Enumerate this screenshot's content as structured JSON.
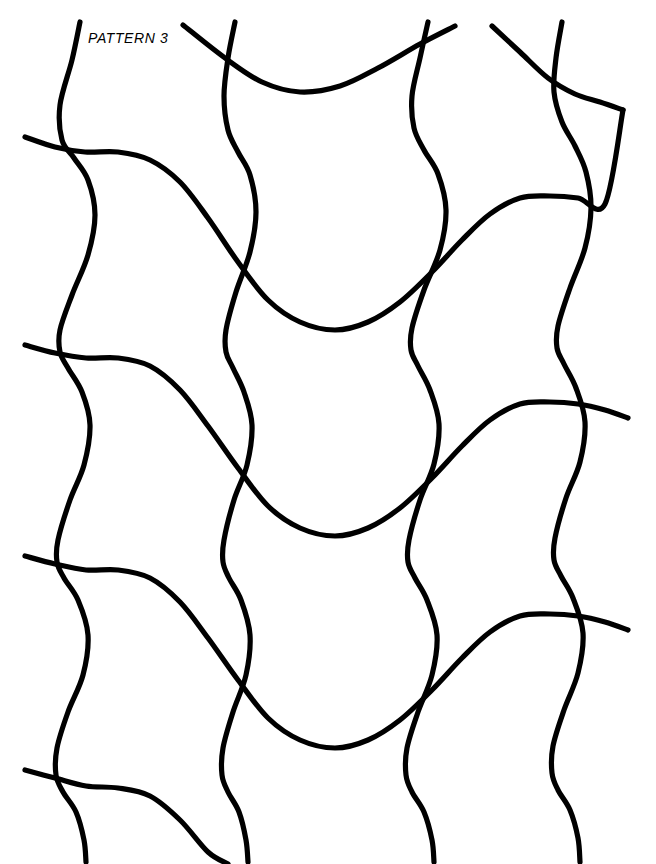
{
  "page": {
    "title": "Pattern 3",
    "width": 656,
    "height": 864,
    "background_color": "#ffffff"
  },
  "label": {
    "text": "PATTERN 3",
    "color": "#000000",
    "x": 88,
    "y": 30,
    "font_size": 14,
    "italic": true
  },
  "artwork": {
    "name": "wavy-lattice",
    "stroke_color": "#000000",
    "stroke_width": 5.2,
    "stroke_linecap": "round",
    "fill": "none",
    "description": "Interlocking grid of vertical wavy lines and gently descending horizontal wavy lines",
    "vertical_lines": {
      "count": 5,
      "x_starts": [
        80,
        235,
        390,
        545,
        700
      ],
      "amplitude": 22,
      "period": 210,
      "phase": 0,
      "drift_per_period": -4
    },
    "horizontal_lines": {
      "count": 5,
      "y_starts": [
        -72,
        137,
        345,
        556,
        770
      ],
      "x_start": 25,
      "x_end": 632,
      "amplitude": 30,
      "period": 208,
      "rise": -28
    }
  },
  "chart_data": {
    "type": "line",
    "title": "PATTERN 3",
    "xlabel": "",
    "ylabel": "",
    "grid": false,
    "legend": "none",
    "xlim": [
      0,
      656
    ],
    "ylim": [
      0,
      864
    ],
    "series": [
      {
        "name": "vertical-wave-1",
        "orientation": "vertical",
        "points": [
          [
            80,
            22
          ],
          [
            72,
            60
          ],
          [
            60,
            105
          ],
          [
            62,
            140
          ],
          [
            74,
            158
          ],
          [
            88,
            180
          ],
          [
            95,
            215
          ],
          [
            88,
            255
          ],
          [
            72,
            295
          ],
          [
            60,
            330
          ],
          [
            60,
            352
          ],
          [
            68,
            368
          ],
          [
            82,
            392
          ],
          [
            90,
            425
          ],
          [
            84,
            465
          ],
          [
            70,
            500
          ],
          [
            58,
            540
          ],
          [
            57,
            562
          ],
          [
            64,
            578
          ],
          [
            78,
            600
          ],
          [
            88,
            635
          ],
          [
            83,
            675
          ],
          [
            68,
            712
          ],
          [
            57,
            748
          ],
          [
            56,
            775
          ],
          [
            63,
            792
          ],
          [
            76,
            812
          ],
          [
            84,
            840
          ],
          [
            86,
            862
          ]
        ]
      },
      {
        "name": "vertical-wave-2",
        "orientation": "vertical",
        "points": [
          [
            235,
            22
          ],
          [
            228,
            58
          ],
          [
            224,
            96
          ],
          [
            228,
            130
          ],
          [
            238,
            152
          ],
          [
            250,
            175
          ],
          [
            256,
            212
          ],
          [
            250,
            252
          ],
          [
            236,
            292
          ],
          [
            226,
            330
          ],
          [
            226,
            352
          ],
          [
            233,
            368
          ],
          [
            244,
            392
          ],
          [
            252,
            425
          ],
          [
            247,
            465
          ],
          [
            234,
            500
          ],
          [
            224,
            540
          ],
          [
            223,
            562
          ],
          [
            229,
            578
          ],
          [
            241,
            600
          ],
          [
            250,
            635
          ],
          [
            246,
            675
          ],
          [
            233,
            712
          ],
          [
            223,
            748
          ],
          [
            222,
            775
          ],
          [
            228,
            792
          ],
          [
            239,
            812
          ],
          [
            246,
            840
          ],
          [
            248,
            862
          ]
        ]
      },
      {
        "name": "vertical-wave-3",
        "orientation": "vertical",
        "points": [
          [
            428,
            22
          ],
          [
            420,
            58
          ],
          [
            412,
            96
          ],
          [
            414,
            128
          ],
          [
            424,
            150
          ],
          [
            438,
            174
          ],
          [
            446,
            210
          ],
          [
            440,
            250
          ],
          [
            424,
            290
          ],
          [
            412,
            328
          ],
          [
            411,
            350
          ],
          [
            418,
            366
          ],
          [
            430,
            390
          ],
          [
            439,
            424
          ],
          [
            434,
            464
          ],
          [
            420,
            500
          ],
          [
            409,
            540
          ],
          [
            408,
            562
          ],
          [
            415,
            578
          ],
          [
            427,
            600
          ],
          [
            437,
            635
          ],
          [
            432,
            675
          ],
          [
            418,
            712
          ],
          [
            407,
            748
          ],
          [
            406,
            775
          ],
          [
            412,
            792
          ],
          [
            424,
            812
          ],
          [
            432,
            840
          ],
          [
            434,
            862
          ]
        ]
      },
      {
        "name": "vertical-wave-4",
        "orientation": "vertical",
        "points": [
          [
            562,
            22
          ],
          [
            556,
            58
          ],
          [
            554,
            92
          ],
          [
            562,
            122
          ],
          [
            575,
            146
          ],
          [
            586,
            172
          ],
          [
            591,
            208
          ],
          [
            585,
            248
          ],
          [
            570,
            288
          ],
          [
            558,
            326
          ],
          [
            557,
            348
          ],
          [
            564,
            364
          ],
          [
            576,
            388
          ],
          [
            585,
            422
          ],
          [
            580,
            462
          ],
          [
            566,
            498
          ],
          [
            555,
            538
          ],
          [
            554,
            560
          ],
          [
            561,
            576
          ],
          [
            573,
            598
          ],
          [
            583,
            633
          ],
          [
            578,
            673
          ],
          [
            564,
            710
          ],
          [
            553,
            746
          ],
          [
            552,
            773
          ],
          [
            558,
            790
          ],
          [
            570,
            810
          ],
          [
            578,
            838
          ],
          [
            580,
            862
          ]
        ]
      },
      {
        "name": "horizontal-wave-0",
        "orientation": "horizontal",
        "points": [
          [
            183,
            25
          ],
          [
            225,
            58
          ],
          [
            262,
            82
          ],
          [
            300,
            92
          ],
          [
            340,
            86
          ],
          [
            378,
            68
          ],
          [
            420,
            44
          ],
          [
            455,
            26
          ]
        ]
      },
      {
        "name": "horizontal-wave-0b",
        "orientation": "horizontal",
        "points": [
          [
            492,
            26
          ],
          [
            520,
            52
          ],
          [
            548,
            78
          ],
          [
            575,
            94
          ],
          [
            600,
            102
          ],
          [
            623,
            110
          ]
        ]
      },
      {
        "name": "horizontal-wave-1",
        "orientation": "horizontal",
        "points": [
          [
            25,
            137
          ],
          [
            55,
            147
          ],
          [
            85,
            152
          ],
          [
            118,
            152
          ],
          [
            150,
            160
          ],
          [
            180,
            182
          ],
          [
            208,
            218
          ],
          [
            238,
            262
          ],
          [
            268,
            300
          ],
          [
            300,
            322
          ],
          [
            335,
            330
          ],
          [
            368,
            322
          ],
          [
            400,
            302
          ],
          [
            432,
            272
          ],
          [
            462,
            240
          ],
          [
            490,
            214
          ],
          [
            520,
            198
          ],
          [
            550,
            196
          ],
          [
            578,
            198
          ],
          [
            605,
            204
          ],
          [
            623,
            110
          ]
        ]
      },
      {
        "name": "horizontal-wave-2",
        "orientation": "horizontal",
        "points": [
          [
            25,
            345
          ],
          [
            55,
            353
          ],
          [
            86,
            358
          ],
          [
            118,
            358
          ],
          [
            150,
            366
          ],
          [
            180,
            390
          ],
          [
            208,
            426
          ],
          [
            238,
            468
          ],
          [
            268,
            506
          ],
          [
            300,
            528
          ],
          [
            335,
            536
          ],
          [
            368,
            528
          ],
          [
            400,
            508
          ],
          [
            432,
            478
          ],
          [
            462,
            446
          ],
          [
            490,
            420
          ],
          [
            520,
            404
          ],
          [
            550,
            402
          ],
          [
            578,
            404
          ],
          [
            605,
            410
          ],
          [
            628,
            418
          ]
        ]
      },
      {
        "name": "horizontal-wave-3",
        "orientation": "horizontal",
        "points": [
          [
            25,
            556
          ],
          [
            55,
            564
          ],
          [
            86,
            570
          ],
          [
            118,
            570
          ],
          [
            150,
            578
          ],
          [
            180,
            602
          ],
          [
            208,
            638
          ],
          [
            238,
            680
          ],
          [
            268,
            718
          ],
          [
            300,
            740
          ],
          [
            335,
            748
          ],
          [
            368,
            740
          ],
          [
            400,
            720
          ],
          [
            432,
            690
          ],
          [
            462,
            658
          ],
          [
            490,
            632
          ],
          [
            520,
            616
          ],
          [
            550,
            614
          ],
          [
            578,
            616
          ],
          [
            605,
            622
          ],
          [
            628,
            630
          ]
        ]
      },
      {
        "name": "horizontal-wave-4",
        "orientation": "horizontal",
        "points": [
          [
            25,
            770
          ],
          [
            55,
            778
          ],
          [
            86,
            786
          ],
          [
            118,
            788
          ],
          [
            150,
            796
          ],
          [
            180,
            820
          ],
          [
            208,
            852
          ],
          [
            228,
            864
          ]
        ]
      }
    ]
  }
}
